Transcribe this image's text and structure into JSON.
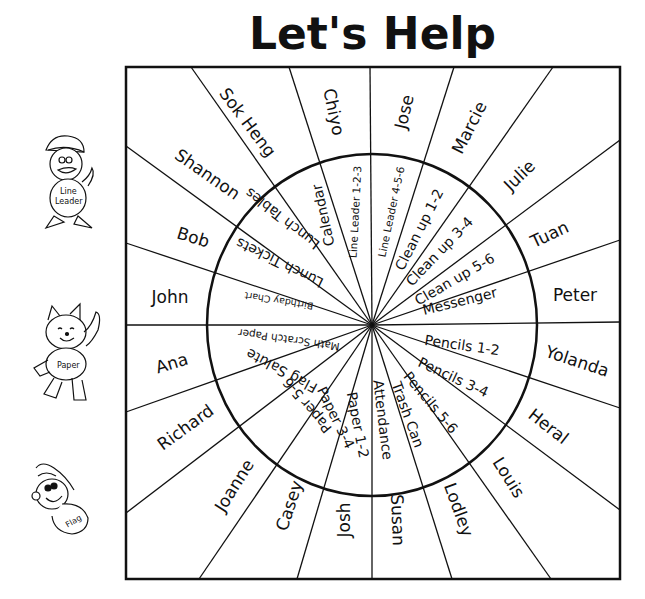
{
  "title": "Let's Help",
  "wheel": {
    "center": [
      372,
      325
    ],
    "box": {
      "x1": 126,
      "y1": 67,
      "x2": 620,
      "y2": 579
    },
    "circle": {
      "rx": 165,
      "ry": 171
    },
    "spoke_endpoints": [
      [
        191,
        67
      ],
      [
        289,
        67
      ],
      [
        370,
        67
      ],
      [
        454,
        67
      ],
      [
        553,
        67
      ],
      [
        620,
        140
      ],
      [
        620,
        240
      ],
      [
        620,
        322
      ],
      [
        620,
        408
      ],
      [
        620,
        510
      ],
      [
        551,
        579
      ],
      [
        452,
        579
      ],
      [
        372,
        579
      ],
      [
        297,
        579
      ],
      [
        199,
        579
      ],
      [
        126,
        513
      ],
      [
        126,
        412
      ],
      [
        126,
        325
      ],
      [
        126,
        243
      ],
      [
        126,
        146
      ]
    ],
    "slots": [
      {
        "name": "Sok Heng",
        "duty": "Lunch Tables",
        "name_pos": [
          247,
          123
        ],
        "name_rot": 53,
        "duty_pos": [
          283,
          218
        ],
        "duty_rot": 218,
        "duty_size": "normal"
      },
      {
        "name": "Chiyo",
        "duty": "Calendar",
        "name_pos": [
          333,
          112
        ],
        "name_rot": 78,
        "duty_pos": [
          324,
          215
        ],
        "duty_rot": 258,
        "duty_size": "normal"
      },
      {
        "name": "Jose",
        "duty": "Line Leader 1-2-3",
        "name_pos": [
          405,
          112
        ],
        "name_rot": -77,
        "duty_pos": [
          356,
          212
        ],
        "duty_rot": -87,
        "duty_size": "small"
      },
      {
        "name": "Marcie",
        "duty": "Line Leader 4-5-6",
        "name_pos": [
          470,
          128
        ],
        "name_rot": -63,
        "duty_pos": [
          392,
          212
        ],
        "duty_rot": -78,
        "duty_size": "small"
      },
      {
        "name": "Julie",
        "duty": "Clean up 1-2",
        "name_pos": [
          520,
          176
        ],
        "name_rot": -44,
        "duty_pos": [
          420,
          230
        ],
        "duty_rot": -63,
        "duty_size": "normal"
      },
      {
        "name": "Tuan",
        "duty": "Clean up 3-4",
        "name_pos": [
          550,
          235
        ],
        "name_rot": -25,
        "duty_pos": [
          440,
          252
        ],
        "duty_rot": -46,
        "duty_size": "normal"
      },
      {
        "name": "Peter",
        "duty": "Clean up 5-6",
        "name_pos": [
          575,
          296
        ],
        "name_rot": 0,
        "duty_pos": [
          455,
          280
        ],
        "duty_rot": -30,
        "duty_size": "normal"
      },
      {
        "name": "Yolanda",
        "duty": "Messenger",
        "name_pos": [
          577,
          362
        ],
        "name_rot": 18,
        "duty_pos": [
          460,
          302
        ],
        "duty_rot": -14,
        "duty_size": "normal"
      },
      {
        "name": "Heral",
        "duty": "Pencils 1-2",
        "name_pos": [
          548,
          427
        ],
        "name_rot": 38,
        "duty_pos": [
          462,
          346
        ],
        "duty_rot": 8,
        "duty_size": "normal"
      },
      {
        "name": "Louis",
        "duty": "Pencils 3-4",
        "name_pos": [
          508,
          478
        ],
        "name_rot": 58,
        "duty_pos": [
          453,
          378
        ],
        "duty_rot": 25,
        "duty_size": "normal"
      },
      {
        "name": "Lodley",
        "duty": "Pencils 5-6",
        "name_pos": [
          458,
          510
        ],
        "name_rot": 70,
        "duty_pos": [
          430,
          403
        ],
        "duty_rot": 50,
        "duty_size": "normal"
      },
      {
        "name": "Susan",
        "duty": "Trash Can",
        "name_pos": [
          397,
          520
        ],
        "name_rot": 88,
        "duty_pos": [
          407,
          415
        ],
        "duty_rot": 70,
        "duty_size": "normal"
      },
      {
        "name": "Josh",
        "duty": "Attendance",
        "name_pos": [
          345,
          520
        ],
        "name_rot": -90,
        "duty_pos": [
          382,
          420
        ],
        "duty_rot": 83,
        "duty_size": "normal"
      },
      {
        "name": "Casey",
        "duty": "Paper 1-2",
        "name_pos": [
          290,
          506
        ],
        "name_rot": -72,
        "duty_pos": [
          357,
          425
        ],
        "duty_rot": 79,
        "duty_size": "normal"
      },
      {
        "name": "Joanne",
        "duty": "Paper 3-4",
        "name_pos": [
          235,
          486
        ],
        "name_rot": -58,
        "duty_pos": [
          335,
          418
        ],
        "duty_rot": 64,
        "duty_size": "normal"
      },
      {
        "name": "Richard",
        "duty": "Paper 5-6",
        "name_pos": [
          186,
          428
        ],
        "name_rot": -36,
        "duty_pos": [
          308,
          405
        ],
        "duty_rot": 230,
        "duty_size": "normal"
      },
      {
        "name": "Ana",
        "duty": "Flag Salute",
        "name_pos": [
          172,
          364
        ],
        "name_rot": -17,
        "duty_pos": [
          282,
          370
        ],
        "duty_rot": 208,
        "duty_size": "normal"
      },
      {
        "name": "John",
        "duty": "Math Scratch Paper",
        "name_pos": [
          170,
          298
        ],
        "name_rot": 0,
        "duty_pos": [
          289,
          339
        ],
        "duty_rot": 188,
        "duty_size": "small"
      },
      {
        "name": "Bob",
        "duty": "Birthday Chart",
        "name_pos": [
          193,
          238
        ],
        "name_rot": 17,
        "duty_pos": [
          279,
          300
        ],
        "duty_rot": 189,
        "duty_size": "tiny"
      },
      {
        "name": "Shannon",
        "duty": "Lunch Tickets",
        "name_pos": [
          207,
          175
        ],
        "name_rot": 35,
        "duty_pos": [
          280,
          262
        ],
        "duty_rot": 206,
        "duty_size": "normal"
      }
    ]
  },
  "mascots": [
    {
      "label_line1": "Line",
      "label_line2": "Leader",
      "icon": "duck-icon"
    },
    {
      "label_line1": "Paper",
      "label_line2": "",
      "icon": "cat-icon"
    },
    {
      "label_line1": "Flag",
      "label_line2": "",
      "icon": "bear-icon"
    }
  ]
}
